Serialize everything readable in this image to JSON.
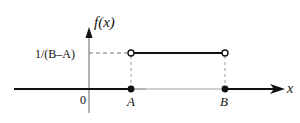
{
  "diagram": {
    "type": "uniform-pdf-plot",
    "y_axis_label": "f(x)",
    "x_axis_label": "x",
    "origin_label": "0",
    "level_label": "1/(B–A)",
    "point_a_label": "A",
    "point_b_label": "B",
    "colors": {
      "line": "#111111",
      "dashed": "#666666",
      "axis": "#555555",
      "background": "#ffffff"
    }
  }
}
